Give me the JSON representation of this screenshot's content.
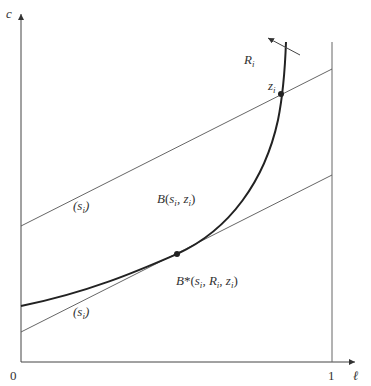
{
  "diagram": {
    "axes": {
      "y_label": "c",
      "x_label": "ℓ",
      "origin_label": "0",
      "x_tick_label": "1"
    },
    "labels": {
      "curve": "R",
      "curve_sub": "i",
      "point_top": "z",
      "point_top_sub": "i",
      "upper_line": "(s_i)",
      "lower_line": "(s_i)",
      "budget": "B(s_i, z_i)",
      "budget_opt": "B*(s_i, R_i, z_i)"
    },
    "colors": {
      "ink": "#333333",
      "thin": "#555555"
    }
  }
}
